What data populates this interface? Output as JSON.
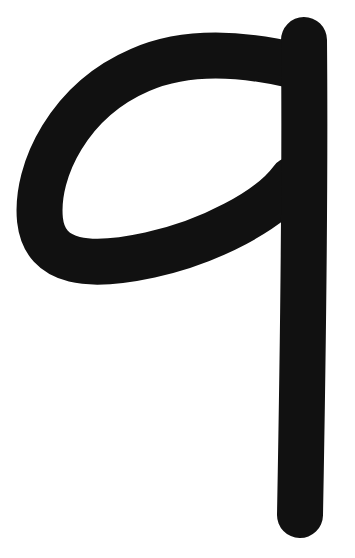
{
  "image": {
    "subject": "letter q",
    "glyph": "q",
    "style": "handwritten single-stroke lowercase letter",
    "colors": {
      "background": "#ffffff",
      "stroke": "#111111"
    }
  }
}
